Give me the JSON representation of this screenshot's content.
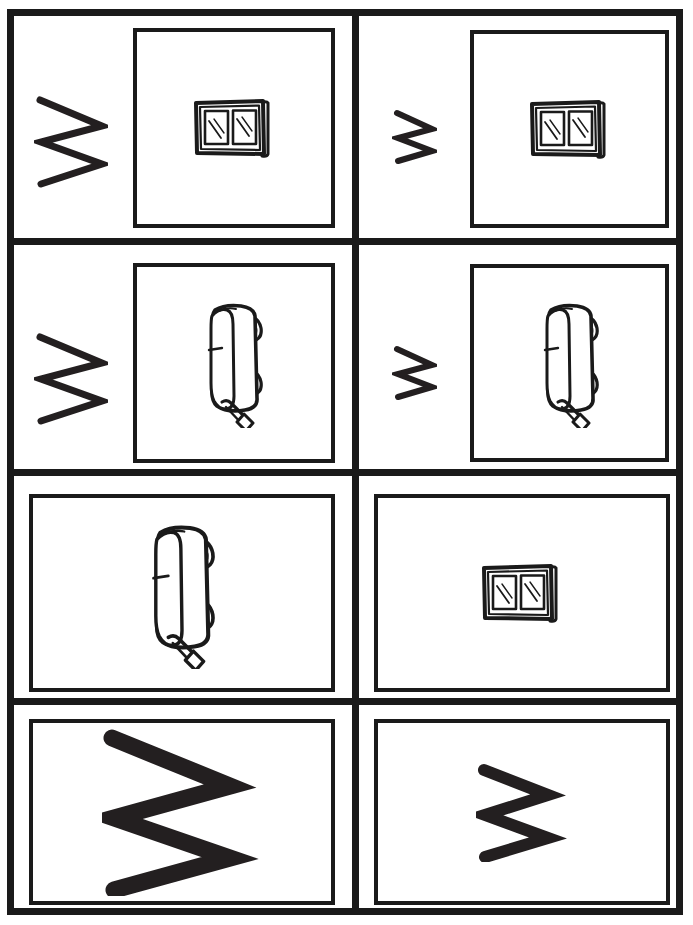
{
  "worksheet": {
    "title": "Letter W tracing and picture matching worksheet",
    "background_color": "#ffffff",
    "ink_color": "#1a1a1a",
    "stroke_color": "#231f20",
    "columns": 2,
    "rows": 4
  },
  "cells": [
    {
      "id": "r1c1",
      "row": 1,
      "column": 1,
      "zigzag": {
        "present": true,
        "size": "large",
        "name": "zigzag-letter-w-large"
      },
      "picture": {
        "present": true,
        "subject": "window",
        "name": "window-clipart",
        "frame": "square"
      }
    },
    {
      "id": "r1c2",
      "row": 1,
      "column": 2,
      "zigzag": {
        "present": true,
        "size": "small",
        "name": "zigzag-letter-w-small"
      },
      "picture": {
        "present": true,
        "subject": "window",
        "name": "window-clipart",
        "frame": "square"
      }
    },
    {
      "id": "r2c1",
      "row": 2,
      "column": 1,
      "zigzag": {
        "present": true,
        "size": "large",
        "name": "zigzag-letter-w-large"
      },
      "picture": {
        "present": true,
        "subject": "wagon",
        "name": "wagon-clipart",
        "frame": "square"
      }
    },
    {
      "id": "r2c2",
      "row": 2,
      "column": 2,
      "zigzag": {
        "present": true,
        "size": "small",
        "name": "zigzag-letter-w-small"
      },
      "picture": {
        "present": true,
        "subject": "wagon",
        "name": "wagon-clipart",
        "frame": "square"
      }
    },
    {
      "id": "r3c1",
      "row": 3,
      "column": 1,
      "zigzag": {
        "present": false
      },
      "picture": {
        "present": true,
        "subject": "wagon",
        "name": "wagon-clipart",
        "frame": "wide"
      }
    },
    {
      "id": "r3c2",
      "row": 3,
      "column": 2,
      "zigzag": {
        "present": false
      },
      "picture": {
        "present": true,
        "subject": "window",
        "name": "window-clipart",
        "frame": "wide"
      }
    },
    {
      "id": "r4c1",
      "row": 4,
      "column": 1,
      "zigzag": {
        "present": true,
        "size": "huge",
        "name": "zigzag-letter-w-huge"
      },
      "picture": {
        "present": false,
        "frame": "wide"
      }
    },
    {
      "id": "r4c2",
      "row": 4,
      "column": 2,
      "zigzag": {
        "present": true,
        "size": "medium",
        "name": "zigzag-letter-w-medium"
      },
      "picture": {
        "present": false,
        "frame": "wide"
      }
    }
  ],
  "clipart": {
    "window": {
      "label": "window",
      "panes": 2,
      "shine_lines_per_pane": 2,
      "has_side_shutter": true
    },
    "wagon": {
      "label": "wagon",
      "wheels": 2,
      "has_handle": true,
      "orientation": "rotated-sideways"
    }
  }
}
